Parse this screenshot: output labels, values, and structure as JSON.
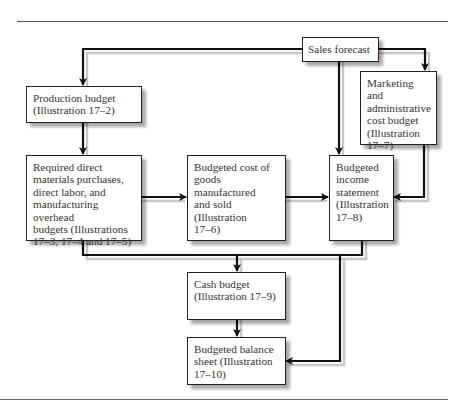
{
  "diagram": {
    "nodes": [
      {
        "id": "sales_forecast",
        "label": "Sales forecast"
      },
      {
        "id": "production_budget",
        "label": "Production budget\n(Illustration 17–2)"
      },
      {
        "id": "marketing_budget",
        "label": "Marketing and\nadministrative\ncost budget\n(Illustration\n17–7)"
      },
      {
        "id": "direct_budgets",
        "label": "Required direct\nmaterials purchases,\ndirect labor, and\nmanufacturing overhead\nbudgets (Illustrations\n17–3, 17–4 and 17–5)"
      },
      {
        "id": "cogs_budget",
        "label": "Budgeted cost of\ngoods manufactured\nand sold (Illustration\n17–6)"
      },
      {
        "id": "income_statement",
        "label": "Budgeted\nincome\nstatement\n(Illustration\n17–8)"
      },
      {
        "id": "cash_budget",
        "label": "Cash budget\n(Illustration 17–9)"
      },
      {
        "id": "balance_sheet",
        "label": "Budgeted balance\nsheet (Illustration\n17–10)"
      }
    ],
    "edges": [
      {
        "from": "sales_forecast",
        "to": "production_budget"
      },
      {
        "from": "sales_forecast",
        "to": "marketing_budget"
      },
      {
        "from": "sales_forecast",
        "to": "income_statement"
      },
      {
        "from": "production_budget",
        "to": "direct_budgets"
      },
      {
        "from": "direct_budgets",
        "to": "cogs_budget"
      },
      {
        "from": "cogs_budget",
        "to": "income_statement"
      },
      {
        "from": "marketing_budget",
        "to": "income_statement"
      },
      {
        "from": "direct_budgets",
        "to": "cash_budget"
      },
      {
        "from": "income_statement",
        "to": "cash_budget"
      },
      {
        "from": "cash_budget",
        "to": "balance_sheet"
      },
      {
        "from": "income_statement",
        "to": "balance_sheet"
      }
    ]
  }
}
